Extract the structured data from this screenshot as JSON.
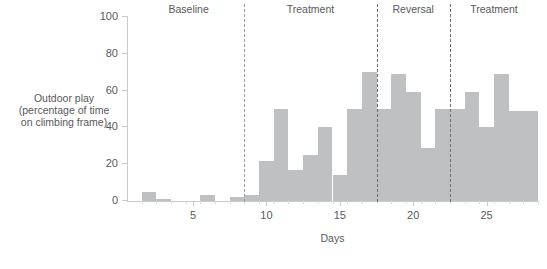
{
  "chart_data": {
    "type": "bar",
    "title": "",
    "subtitle": "",
    "xlabel": "Days",
    "ylabel": "Outdoor play (percentage of time on climbing frame)",
    "ylabel_lines": [
      "Outdoor play",
      "(percentage of time",
      "on climbing frame)"
    ],
    "ylim": [
      0,
      100
    ],
    "yticks": [
      0,
      20,
      40,
      60,
      80,
      100
    ],
    "ytick_labels": [
      "0",
      "20",
      "40",
      "60",
      "80",
      "100"
    ],
    "xlim": [
      0.5,
      28.5
    ],
    "xticks": [
      5,
      10,
      15,
      20,
      25
    ],
    "xtick_labels": [
      "5",
      "10",
      "15",
      "20",
      "25"
    ],
    "grid": false,
    "legend": false,
    "bar_color": "#bfc0c2",
    "axis_color": "#c9cacc",
    "text_color": "#58595b",
    "categories": [
      1,
      2,
      3,
      4,
      5,
      6,
      7,
      8,
      9,
      10,
      11,
      12,
      13,
      14,
      15,
      16,
      17,
      18,
      19,
      20,
      21,
      22,
      23,
      24,
      25,
      26,
      27,
      28
    ],
    "values": [
      0,
      5,
      1,
      0,
      0,
      3,
      0,
      2,
      3,
      22,
      50,
      17,
      25,
      40,
      14,
      50,
      70,
      50,
      69,
      59,
      29,
      50,
      50,
      59,
      40,
      69,
      49,
      49
    ],
    "annotations": [
      {
        "label": "Baseline",
        "x_center": 4.7,
        "phase_start": 0.5,
        "phase_end": 8.5
      },
      {
        "label": "Treatment",
        "x_center": 13.0,
        "phase_start": 8.5,
        "phase_end": 17.5
      },
      {
        "label": "Reversal",
        "x_center": 20.0,
        "phase_start": 17.5,
        "phase_end": 22.5
      },
      {
        "label": "Treatment",
        "x_center": 25.5,
        "phase_start": 22.5,
        "phase_end": 28.5
      }
    ],
    "dividers": [
      {
        "x": 8.5,
        "style": "dashed-light"
      },
      {
        "x": 17.5,
        "style": "dashed-dark"
      },
      {
        "x": 22.5,
        "style": "dashed-dark"
      }
    ]
  }
}
